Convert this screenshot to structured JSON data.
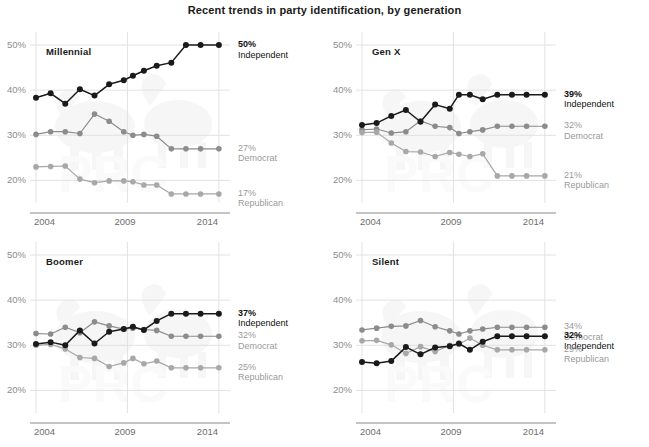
{
  "chart_data": {
    "type": "line",
    "title": "Recent trends in party identification, by generation",
    "xlabel": "",
    "ylabel": "",
    "xlim": [
      2004,
      2014.5
    ],
    "ylim": [
      15,
      52
    ],
    "yticks": [
      "20%",
      "30%",
      "40%",
      "50%"
    ],
    "ytick_values": [
      20,
      30,
      40,
      50
    ],
    "xticks": [
      "2004",
      "2009",
      "2014"
    ],
    "xtick_values": [
      2004,
      2009,
      2014
    ],
    "grid": "horizontal-and-vertical-light",
    "legend_position": "right-of-line-end",
    "colors": {
      "independent": "#1a1a1a",
      "democrat": "#8c8c8c",
      "republican": "#a8a8a8",
      "gridline": "#e2e2e2",
      "axis": "#8a8a8a",
      "title": "#1a1a1a",
      "tick_text": "#8d8d8d"
    },
    "x": [
      2004,
      2004.8,
      2005.6,
      2006.4,
      2007.2,
      2008,
      2008.8,
      2009.3,
      2009.9,
      2010.6,
      2011.4,
      2012.2,
      2013,
      2014
    ],
    "panels": [
      {
        "name": "Millennial",
        "series": [
          {
            "name": "Independent",
            "key": "independent",
            "end_value": "50%",
            "end_label": "Independent",
            "values": [
              38.3,
              39.3,
              37.0,
              40.2,
              38.8,
              41.3,
              42.2,
              43.2,
              44.3,
              45.4,
              46.1,
              50.0,
              50.0,
              50.0
            ]
          },
          {
            "name": "Democrat",
            "key": "democrat",
            "end_value": "27%",
            "end_label": "Democrat",
            "values": [
              30.2,
              30.8,
              30.8,
              30.4,
              34.7,
              33.1,
              30.8,
              30.0,
              30.2,
              29.8,
              27.0,
              27.0,
              27.0,
              27.0
            ]
          },
          {
            "name": "Republican",
            "key": "republican",
            "end_value": "17%",
            "end_label": "Republican",
            "values": [
              23.0,
              23.1,
              23.2,
              20.3,
              19.5,
              19.9,
              19.9,
              19.7,
              19.0,
              19.0,
              17.0,
              17.0,
              17.0,
              17.0
            ]
          }
        ]
      },
      {
        "name": "Gen X",
        "series": [
          {
            "name": "Independent",
            "key": "independent",
            "end_value": "39%",
            "end_label": "Independent",
            "values": [
              32.3,
              32.7,
              34.3,
              35.6,
              33.0,
              36.8,
              35.9,
              39.0,
              39.0,
              38.0,
              39.0,
              39.0,
              39.0,
              39.0
            ]
          },
          {
            "name": "Democrat",
            "key": "democrat",
            "end_value": "32%",
            "end_label": "Democrat",
            "values": [
              31.2,
              31.4,
              30.5,
              30.8,
              33.2,
              32.0,
              31.7,
              30.4,
              30.8,
              31.2,
              32.0,
              32.0,
              32.0,
              32.0
            ]
          },
          {
            "name": "Republican",
            "key": "republican",
            "end_value": "21%",
            "end_label": "Republican",
            "values": [
              30.6,
              30.7,
              28.3,
              26.4,
              26.3,
              25.3,
              26.2,
              25.8,
              25.3,
              25.9,
              21.0,
              21.0,
              21.0,
              21.0
            ]
          }
        ]
      },
      {
        "name": "Boomer",
        "series": [
          {
            "name": "Independent",
            "key": "independent",
            "end_value": "37%",
            "end_label": "Independent",
            "values": [
              30.3,
              30.7,
              30.0,
              33.3,
              30.4,
              33.0,
              33.6,
              34.1,
              33.4,
              35.4,
              37.0,
              37.0,
              37.0,
              37.0
            ]
          },
          {
            "name": "Democrat",
            "key": "democrat",
            "end_value": "32%",
            "end_label": "Democrat",
            "values": [
              32.6,
              32.5,
              34.0,
              32.8,
              35.2,
              34.3,
              33.6,
              33.8,
              33.5,
              33.3,
              32.0,
              32.0,
              32.0,
              32.0
            ]
          },
          {
            "name": "Republican",
            "key": "republican",
            "end_value": "25%",
            "end_label": "Republican",
            "values": [
              30.0,
              30.2,
              29.2,
              27.3,
              27.1,
              25.3,
              26.1,
              27.1,
              25.9,
              26.5,
              25.0,
              25.0,
              25.0,
              25.0
            ]
          }
        ]
      },
      {
        "name": "Silent",
        "series": [
          {
            "name": "Democrat",
            "key": "democrat",
            "end_value": "34%",
            "end_label": "Democrat",
            "values": [
              33.4,
              33.8,
              34.2,
              34.3,
              35.5,
              34.1,
              33.2,
              32.5,
              33.2,
              33.6,
              34.0,
              34.0,
              34.0,
              34.0
            ]
          },
          {
            "name": "Independent",
            "key": "independent",
            "end_value": "32%",
            "end_label": "Independent",
            "values": [
              26.3,
              26.0,
              26.5,
              29.6,
              28.0,
              29.5,
              29.8,
              30.4,
              29.0,
              30.8,
              32.0,
              32.0,
              32.0,
              32.0
            ]
          },
          {
            "name": "Republican",
            "key": "republican",
            "end_value": "29%",
            "end_label": "Republican",
            "values": [
              31.0,
              31.1,
              30.1,
              28.2,
              29.7,
              28.6,
              30.0,
              30.2,
              31.6,
              30.0,
              29.0,
              29.0,
              29.0,
              29.0
            ]
          }
        ]
      }
    ]
  }
}
